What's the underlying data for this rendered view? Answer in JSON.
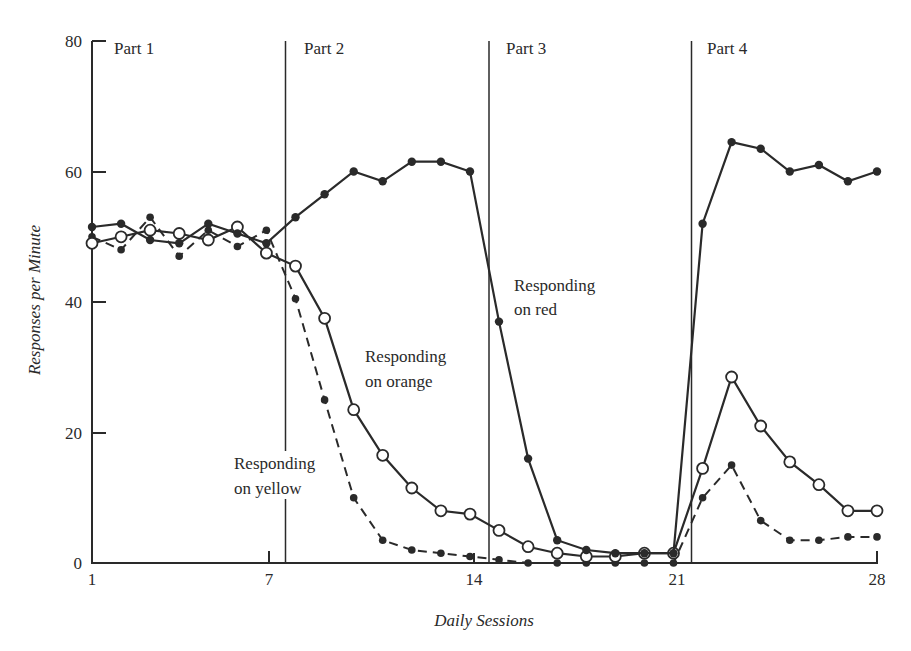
{
  "chart_data": {
    "type": "line",
    "title": "",
    "xlabel": "Daily Sessions",
    "ylabel": "Responses per Minute",
    "xlim": [
      1,
      28
    ],
    "ylim": [
      0,
      80
    ],
    "x_ticks": [
      1,
      7,
      14,
      21,
      28
    ],
    "y_ticks": [
      0,
      20,
      40,
      60,
      80
    ],
    "grid": false,
    "legend": "none (direct annotations)",
    "x": [
      1,
      2,
      3,
      4,
      5,
      6,
      7,
      8,
      9,
      10,
      11,
      12,
      13,
      14,
      15,
      16,
      17,
      18,
      19,
      20,
      21,
      22,
      23,
      24,
      25,
      26,
      27,
      28
    ],
    "phases": [
      {
        "label": "Part 1",
        "start_after_session": 0.9
      },
      {
        "label": "Part 2",
        "start_after_session": 7.5
      },
      {
        "label": "Part 3",
        "start_after_session": 14.5
      },
      {
        "label": "Part 4",
        "start_after_session": 21.5
      }
    ],
    "series": [
      {
        "name": "Responding on red",
        "marker": "filled-circle",
        "line": "solid",
        "values": [
          51.5,
          52,
          49.5,
          49,
          52,
          50.5,
          49,
          53,
          56.5,
          60,
          58.5,
          61.5,
          61.5,
          60,
          37,
          16,
          3.5,
          2,
          1.5,
          1.5,
          1.5,
          52,
          64.5,
          63.5,
          60,
          61,
          58.5,
          60
        ]
      },
      {
        "name": "Responding on orange",
        "marker": "open-circle",
        "line": "solid",
        "values": [
          49,
          50,
          51,
          50.5,
          49.5,
          51.5,
          47.5,
          45.5,
          37.5,
          23.5,
          16.5,
          11.5,
          8,
          7.5,
          5,
          2.5,
          1.5,
          1,
          1,
          1.5,
          1.5,
          14.5,
          28.5,
          21,
          15.5,
          12,
          8,
          8
        ]
      },
      {
        "name": "Responding on yellow",
        "marker": "filled-circle",
        "line": "dashed",
        "values": [
          50,
          48,
          53,
          47,
          51,
          48.5,
          51,
          40.5,
          25,
          10,
          3.5,
          2,
          1.5,
          1,
          0.5,
          0,
          0,
          0,
          0,
          0,
          0,
          10,
          15,
          6.5,
          3.5,
          3.5,
          4,
          4
        ]
      }
    ],
    "annotations": [
      {
        "text": [
          "Responding",
          "on red"
        ],
        "near_session": 15.5,
        "near_value": 42
      },
      {
        "text": [
          "Responding",
          "on orange"
        ],
        "near_session": 10.5,
        "near_value": 30
      },
      {
        "text": [
          "Responding",
          "on yellow"
        ],
        "near_session": 6.5,
        "near_value": 13
      }
    ]
  },
  "labels": {
    "x_axis_title": "Daily Sessions",
    "y_axis_title": "Responses per Minute",
    "part1": "Part 1",
    "part2": "Part 2",
    "part3": "Part 3",
    "part4": "Part 4",
    "red_1": "Responding",
    "red_2": "on red",
    "orange_1": "Responding",
    "orange_2": "on orange",
    "yellow_1": "Responding",
    "yellow_2": "on yellow",
    "xt_1": "1",
    "xt_7": "7",
    "xt_14": "14",
    "xt_21": "21",
    "xt_28": "28",
    "yt_0": "0",
    "yt_20": "20",
    "yt_40": "40",
    "yt_60": "60",
    "yt_80": "80"
  }
}
